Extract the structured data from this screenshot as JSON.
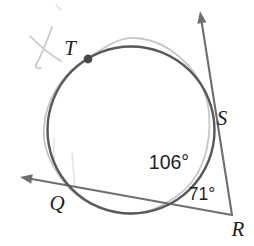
{
  "figure": {
    "type": "geometry-diagram",
    "labels": {
      "T": "T",
      "S": "S",
      "Q": "Q",
      "R": "R"
    },
    "angles": {
      "arc_angle": "106°",
      "vertex_angle": "71°",
      "arc_angle_value": 106,
      "vertex_angle_value": 71
    },
    "colors": {
      "circle": "#595959",
      "line": "#6f6f6f",
      "arrow": "#6f6f6f",
      "pencil": "#c7c7c7",
      "pencil_faint": "#e2e2e2",
      "dot": "#474747",
      "text": "#1e1e1e"
    }
  }
}
